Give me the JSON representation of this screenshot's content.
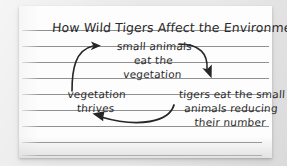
{
  "canvas": {
    "width": 287,
    "height": 166,
    "background_color": "#e9e9e9"
  },
  "paper": {
    "name": "ruled-notebook-sheet",
    "background_color": "#fdfdfd",
    "rule_color": "#7c7c7c",
    "ink_color": "#2b2b2b",
    "rule_count": 9,
    "rule_positions": [
      24,
      40,
      56,
      72,
      88,
      104,
      120,
      136,
      152
    ]
  },
  "diagram": {
    "type": "cycle",
    "title": "How Wild Tigers Affect the Environment",
    "nodes": [
      {
        "id": "small-animals",
        "lines": [
          "small animals",
          "eat the",
          "vegetation"
        ],
        "text": "small animals eat the vegetation"
      },
      {
        "id": "tigers-eat",
        "lines": [
          "tigers eat the small",
          "animals reducing",
          "their number"
        ],
        "text": "tigers eat the small animals reducing their number"
      },
      {
        "id": "vegetation-thrives",
        "lines": [
          "vegetation",
          "thrives"
        ],
        "text": "vegetation thrives"
      }
    ],
    "arrows": [
      {
        "id": "arrow-vegetation-to-small-animals",
        "from": "vegetation-thrives",
        "to": "small-animals",
        "direction": "up-right"
      },
      {
        "id": "arrow-small-animals-to-tigers",
        "from": "small-animals",
        "to": "tigers-eat",
        "direction": "down-right"
      },
      {
        "id": "arrow-tigers-to-vegetation",
        "from": "tigers-eat",
        "to": "vegetation-thrives",
        "direction": "left"
      }
    ]
  }
}
